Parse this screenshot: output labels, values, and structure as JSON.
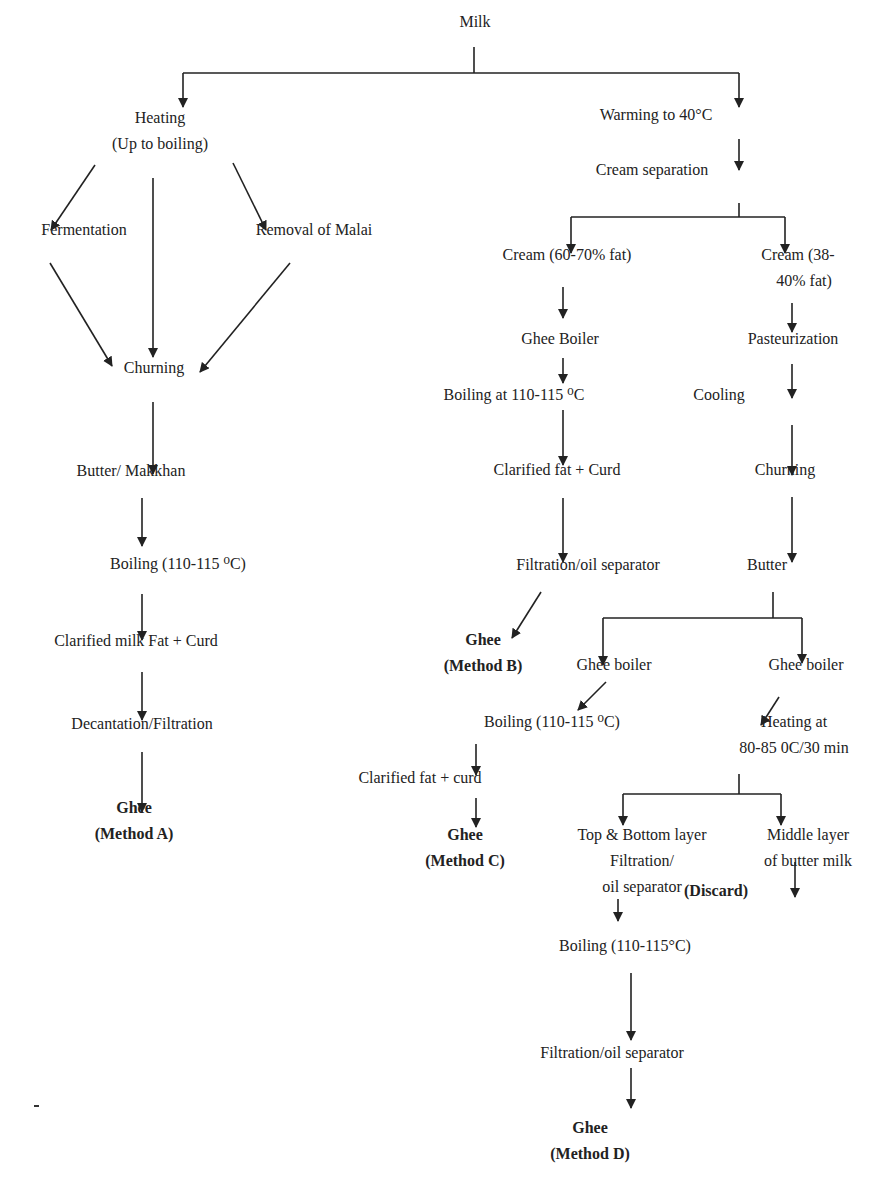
{
  "diagram": {
    "colors": {
      "text": "#222222",
      "line": "#222222",
      "background": "#ffffff"
    },
    "nodes": [
      {
        "id": "milk",
        "lines": [
          "Milk"
        ],
        "x": 475,
        "y": 22,
        "bold": false
      },
      {
        "id": "heating",
        "lines": [
          "Heating",
          "(Up to boiling)"
        ],
        "x": 160,
        "y": 118,
        "bold": false
      },
      {
        "id": "fermentation",
        "lines": [
          "Fermentation"
        ],
        "x": 84,
        "y": 230,
        "bold": false
      },
      {
        "id": "removal-malai",
        "lines": [
          "Removal of Malai"
        ],
        "x": 314,
        "y": 230,
        "bold": false
      },
      {
        "id": "churning-a",
        "lines": [
          "Churning"
        ],
        "x": 154,
        "y": 368,
        "bold": false
      },
      {
        "id": "butter-makkhan",
        "lines": [
          "Butter/ Makkhan"
        ],
        "x": 131,
        "y": 471,
        "bold": false
      },
      {
        "id": "boiling-a",
        "lines": [
          "Boiling (110-115 ⁰C)"
        ],
        "x": 178,
        "y": 564,
        "bold": false
      },
      {
        "id": "clarified-a",
        "lines": [
          "Clarified milk Fat + Curd"
        ],
        "x": 136,
        "y": 641,
        "bold": false
      },
      {
        "id": "decantation",
        "lines": [
          "Decantation/Filtration"
        ],
        "x": 142,
        "y": 724,
        "bold": false
      },
      {
        "id": "ghee-a",
        "lines": [
          "Ghee",
          "(Method A)"
        ],
        "x": 134,
        "y": 808,
        "bold": true
      },
      {
        "id": "warming",
        "lines": [
          "Warming to 40°C"
        ],
        "x": 656,
        "y": 115,
        "bold": false
      },
      {
        "id": "cream-separation",
        "lines": [
          "Cream separation"
        ],
        "x": 652,
        "y": 170,
        "bold": false
      },
      {
        "id": "cream-60-70",
        "lines": [
          "Cream (60-70% fat)"
        ],
        "x": 567,
        "y": 255,
        "bold": false
      },
      {
        "id": "cream-38-40",
        "lines": [
          "Cream (38-",
          "   40% fat)"
        ],
        "x": 798,
        "y": 255,
        "bold": false
      },
      {
        "id": "ghee-boiler-b",
        "lines": [
          "Ghee Boiler"
        ],
        "x": 560,
        "y": 339,
        "bold": false
      },
      {
        "id": "pasteurization",
        "lines": [
          "Pasteurization"
        ],
        "x": 793,
        "y": 339,
        "bold": false
      },
      {
        "id": "boiling-b",
        "lines": [
          "Boiling at 110-115 ⁰C"
        ],
        "x": 514,
        "y": 395,
        "bold": false
      },
      {
        "id": "cooling",
        "lines": [
          "Cooling"
        ],
        "x": 719,
        "y": 395,
        "bold": false
      },
      {
        "id": "clarified-b",
        "lines": [
          "Clarified fat + Curd"
        ],
        "x": 557,
        "y": 470,
        "bold": false
      },
      {
        "id": "churning-d",
        "lines": [
          "Churning"
        ],
        "x": 785,
        "y": 470,
        "bold": false
      },
      {
        "id": "filtration-b",
        "lines": [
          "Filtration/oil separator"
        ],
        "x": 588,
        "y": 565,
        "bold": false
      },
      {
        "id": "butter",
        "lines": [
          "Butter"
        ],
        "x": 767,
        "y": 565,
        "bold": false
      },
      {
        "id": "ghee-b",
        "lines": [
          "Ghee",
          "(Method B)"
        ],
        "x": 483,
        "y": 640,
        "bold": true
      },
      {
        "id": "ghee-boiler-c",
        "lines": [
          "Ghee boiler"
        ],
        "x": 614,
        "y": 665,
        "bold": false
      },
      {
        "id": "ghee-boiler-d",
        "lines": [
          "Ghee boiler"
        ],
        "x": 806,
        "y": 665,
        "bold": false
      },
      {
        "id": "boiling-c",
        "lines": [
          "Boiling (110-115 ⁰C)"
        ],
        "x": 552,
        "y": 722,
        "bold": false
      },
      {
        "id": "heating-d",
        "lines": [
          "Heating at",
          "80-85 0C/30 min"
        ],
        "x": 794,
        "y": 722,
        "bold": false
      },
      {
        "id": "clarified-c",
        "lines": [
          "Clarified fat + curd"
        ],
        "x": 420,
        "y": 778,
        "bold": false
      },
      {
        "id": "ghee-c",
        "lines": [
          "Ghee",
          "(Method C)"
        ],
        "x": 465,
        "y": 835,
        "bold": true
      },
      {
        "id": "top-bottom",
        "lines": [
          "Top & Bottom layer",
          "Filtration/",
          "oil separator"
        ],
        "x": 642,
        "y": 835,
        "bold": false
      },
      {
        "id": "middle-layer",
        "lines": [
          "Middle layer",
          "of butter milk"
        ],
        "x": 808,
        "y": 835,
        "bold": false
      },
      {
        "id": "discard",
        "lines": [
          "(Discard)"
        ],
        "x": 716,
        "y": 891,
        "bold": true
      },
      {
        "id": "boiling-d",
        "lines": [
          "Boiling (110-115°C)"
        ],
        "x": 625,
        "y": 946,
        "bold": false
      },
      {
        "id": "filtration-d",
        "lines": [
          "Filtration/oil separator"
        ],
        "x": 612,
        "y": 1053,
        "bold": false
      },
      {
        "id": "ghee-d",
        "lines": [
          "Ghee",
          "(Method D)"
        ],
        "x": 590,
        "y": 1128,
        "bold": true
      }
    ],
    "edges": [
      {
        "type": "line",
        "pts": [
          [
            474,
            47
          ],
          [
            474,
            73
          ]
        ]
      },
      {
        "type": "line",
        "pts": [
          [
            183,
            73
          ],
          [
            739,
            73
          ]
        ]
      },
      {
        "type": "arrow",
        "pts": [
          [
            183,
            73
          ],
          [
            183,
            107
          ]
        ]
      },
      {
        "type": "arrow",
        "pts": [
          [
            739,
            73
          ],
          [
            739,
            107
          ]
        ]
      },
      {
        "type": "arrow",
        "pts": [
          [
            95,
            165
          ],
          [
            51,
            230
          ]
        ]
      },
      {
        "type": "line",
        "pts": [
          [
            153,
            178
          ],
          [
            153,
            300
          ]
        ]
      },
      {
        "type": "arrow",
        "pts": [
          [
            233,
            163
          ],
          [
            266,
            230
          ]
        ]
      },
      {
        "type": "arrow",
        "pts": [
          [
            50,
            263
          ],
          [
            112,
            366
          ]
        ]
      },
      {
        "type": "arrow",
        "pts": [
          [
            153,
            300
          ],
          [
            153,
            357
          ]
        ]
      },
      {
        "type": "arrow",
        "pts": [
          [
            290,
            263
          ],
          [
            200,
            372
          ]
        ]
      },
      {
        "type": "arrow",
        "pts": [
          [
            153,
            402
          ],
          [
            153,
            474
          ]
        ]
      },
      {
        "type": "arrow",
        "pts": [
          [
            142,
            498
          ],
          [
            142,
            546
          ]
        ]
      },
      {
        "type": "arrow",
        "pts": [
          [
            142,
            594
          ],
          [
            142,
            640
          ]
        ]
      },
      {
        "type": "arrow",
        "pts": [
          [
            142,
            672
          ],
          [
            142,
            720
          ]
        ]
      },
      {
        "type": "arrow",
        "pts": [
          [
            142,
            752
          ],
          [
            142,
            812
          ]
        ]
      },
      {
        "type": "arrow",
        "pts": [
          [
            739,
            139
          ],
          [
            739,
            170
          ]
        ]
      },
      {
        "type": "line",
        "pts": [
          [
            739,
            203
          ],
          [
            739,
            217
          ]
        ]
      },
      {
        "type": "line",
        "pts": [
          [
            571,
            217
          ],
          [
            785,
            217
          ]
        ]
      },
      {
        "type": "arrow",
        "pts": [
          [
            571,
            217
          ],
          [
            571,
            253
          ]
        ]
      },
      {
        "type": "arrow",
        "pts": [
          [
            785,
            217
          ],
          [
            785,
            253
          ]
        ]
      },
      {
        "type": "arrow",
        "pts": [
          [
            563,
            287
          ],
          [
            563,
            318
          ]
        ]
      },
      {
        "type": "arrow",
        "pts": [
          [
            563,
            358
          ],
          [
            563,
            383
          ]
        ]
      },
      {
        "type": "arrow",
        "pts": [
          [
            563,
            410
          ],
          [
            563,
            465
          ]
        ]
      },
      {
        "type": "arrow",
        "pts": [
          [
            563,
            498
          ],
          [
            563,
            562
          ]
        ]
      },
      {
        "type": "arrow",
        "pts": [
          [
            541,
            592
          ],
          [
            512,
            638
          ]
        ]
      },
      {
        "type": "arrow",
        "pts": [
          [
            792,
            303
          ],
          [
            792,
            332
          ]
        ]
      },
      {
        "type": "arrow",
        "pts": [
          [
            792,
            364
          ],
          [
            792,
            398
          ]
        ]
      },
      {
        "type": "arrow",
        "pts": [
          [
            792,
            425
          ],
          [
            792,
            475
          ]
        ]
      },
      {
        "type": "arrow",
        "pts": [
          [
            792,
            497
          ],
          [
            792,
            562
          ]
        ]
      },
      {
        "type": "line",
        "pts": [
          [
            773,
            592
          ],
          [
            773,
            618
          ]
        ]
      },
      {
        "type": "line",
        "pts": [
          [
            603,
            618
          ],
          [
            802,
            618
          ]
        ]
      },
      {
        "type": "arrow",
        "pts": [
          [
            603,
            618
          ],
          [
            603,
            665
          ]
        ]
      },
      {
        "type": "arrow",
        "pts": [
          [
            802,
            618
          ],
          [
            802,
            663
          ]
        ]
      },
      {
        "type": "arrow",
        "pts": [
          [
            606,
            682
          ],
          [
            578,
            710
          ]
        ]
      },
      {
        "type": "arrow",
        "pts": [
          [
            779,
            697
          ],
          [
            761,
            725
          ]
        ]
      },
      {
        "type": "arrow",
        "pts": [
          [
            476,
            744
          ],
          [
            476,
            775
          ]
        ]
      },
      {
        "type": "arrow",
        "pts": [
          [
            476,
            798
          ],
          [
            476,
            827
          ]
        ]
      },
      {
        "type": "line",
        "pts": [
          [
            739,
            774
          ],
          [
            739,
            794
          ]
        ]
      },
      {
        "type": "line",
        "pts": [
          [
            623,
            794
          ],
          [
            781,
            794
          ]
        ]
      },
      {
        "type": "arrow",
        "pts": [
          [
            623,
            794
          ],
          [
            623,
            825
          ]
        ]
      },
      {
        "type": "arrow",
        "pts": [
          [
            781,
            794
          ],
          [
            781,
            825
          ]
        ]
      },
      {
        "type": "arrow",
        "pts": [
          [
            795,
            862
          ],
          [
            795,
            897
          ]
        ]
      },
      {
        "type": "arrow",
        "pts": [
          [
            618,
            899
          ],
          [
            618,
            921
          ]
        ]
      },
      {
        "type": "arrow",
        "pts": [
          [
            631,
            973
          ],
          [
            631,
            1040
          ]
        ]
      },
      {
        "type": "arrow",
        "pts": [
          [
            631,
            1068
          ],
          [
            631,
            1108
          ]
        ]
      }
    ]
  }
}
